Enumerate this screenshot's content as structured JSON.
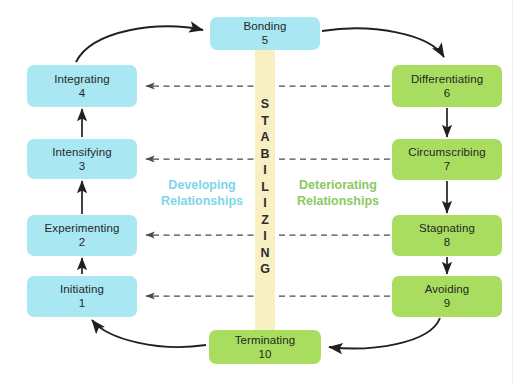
{
  "diagram": {
    "center_band": {
      "name": "STABILIZING",
      "letters": [
        "S",
        "T",
        "A",
        "B",
        "I",
        "L",
        "I",
        "Z",
        "I",
        "N",
        "G"
      ],
      "color": "#f8efc2"
    },
    "captions": {
      "developing": {
        "line1": "Developing",
        "line2": "Relationships",
        "color": "#7fd5e8"
      },
      "deteriorating": {
        "line1": "Deteriorating",
        "line2": "Relationships",
        "color": "#8cc863"
      }
    },
    "colors": {
      "coming_together": "#a9e8f2",
      "coming_apart": "#a9dd5f",
      "stabilizing": "#f8efc2",
      "arrow": "#231f20",
      "dashed_arrow": "#555555",
      "text": "#262626"
    },
    "stages": {
      "top": {
        "label": "Bonding",
        "number": "5",
        "color": "blue"
      },
      "bottom": {
        "label": "Terminating",
        "number": "10",
        "color": "green"
      },
      "left": [
        {
          "label": "Integrating",
          "number": "4",
          "color": "blue"
        },
        {
          "label": "Intensifying",
          "number": "3",
          "color": "blue"
        },
        {
          "label": "Experimenting",
          "number": "2",
          "color": "blue"
        },
        {
          "label": "Initiating",
          "number": "1",
          "color": "blue"
        }
      ],
      "right": [
        {
          "label": "Differentiating",
          "number": "6",
          "color": "green"
        },
        {
          "label": "Circumscribing",
          "number": "7",
          "color": "green"
        },
        {
          "label": "Stagnating",
          "number": "8",
          "color": "green"
        },
        {
          "label": "Avoiding",
          "number": "9",
          "color": "green"
        }
      ]
    }
  }
}
